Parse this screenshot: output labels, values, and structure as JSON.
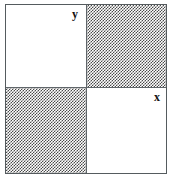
{
  "diagram": {
    "kind": "quadrant-venn-diagram",
    "border_color": "#555b5e",
    "divider_color": "#60666a",
    "stipple_color": "#4a4a4a",
    "blank_color": "#ffffff",
    "labels": {
      "y": "y",
      "x": "x"
    },
    "quadrants": [
      {
        "id": "top-left",
        "position": "top-left",
        "fill": "blank",
        "label": "y"
      },
      {
        "id": "top-right",
        "position": "top-right",
        "fill": "stipple",
        "label": ""
      },
      {
        "id": "bottom-left",
        "position": "bottom-left",
        "fill": "stipple",
        "label": ""
      },
      {
        "id": "bottom-right",
        "position": "bottom-right",
        "fill": "blank",
        "label": "x"
      }
    ]
  }
}
